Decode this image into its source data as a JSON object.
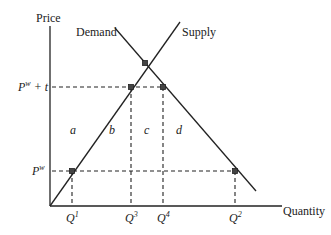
{
  "diagram": {
    "type": "supply-demand-tariff",
    "axes": {
      "y_label": "Price",
      "x_label": "Quantity"
    },
    "curves": {
      "demand_label": "Demand",
      "supply_label": "Supply"
    },
    "price_levels": {
      "tariff_price_base": "P",
      "tariff_price_sup": "w",
      "tariff_price_suffix": " + t",
      "world_price_base": "P",
      "world_price_sup": "w"
    },
    "quantities": [
      {
        "base": "Q",
        "sup": "1"
      },
      {
        "base": "Q",
        "sup": "3"
      },
      {
        "base": "Q",
        "sup": "4"
      },
      {
        "base": "Q",
        "sup": "2"
      }
    ],
    "regions": [
      "a",
      "b",
      "c",
      "d"
    ],
    "colors": {
      "line": "#222222",
      "background": "#ffffff"
    }
  }
}
